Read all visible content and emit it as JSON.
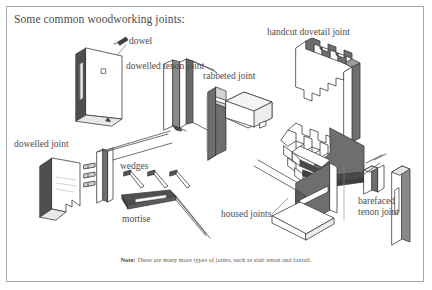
{
  "document": {
    "title": "Some common woodworking joints:",
    "frame_border_color": "#a9a9a9",
    "background_color": "#ffffff",
    "text_color": "#4d4d4d",
    "ink_dark": "#4a4a4a",
    "ink_shade": "#6e6e6e"
  },
  "labels": {
    "dowel": "dowel",
    "dowelled_tenon_joint": "dowelled tenon joint",
    "rabbeted_joint": "rabbeted joint",
    "handcut_dovetail_joint": "handcut dovetail joint",
    "dowelled_joint": "dowelled joint",
    "wedges": "wedges",
    "mortise": "mortise",
    "housed_joints": "housed joints",
    "barefaced_line1": "barefaced",
    "barefaced_line2": "tenon joint"
  },
  "note": {
    "prefix": "Note:",
    "text": " There are many more types of joints, such as stub tenon and foxtail."
  },
  "diagram": {
    "type": "technical-illustration",
    "subject": "woodworking joints",
    "items": [
      {
        "name": "dowel",
        "position": "top-left"
      },
      {
        "name": "dowelled tenon joint",
        "position": "top-left"
      },
      {
        "name": "rabbeted joint",
        "position": "top-center"
      },
      {
        "name": "handcut dovetail joint",
        "position": "top-right"
      },
      {
        "name": "dowelled joint",
        "position": "middle-left"
      },
      {
        "name": "wedges",
        "position": "middle-center"
      },
      {
        "name": "mortise",
        "position": "middle-center"
      },
      {
        "name": "housed joints",
        "position": "bottom-center"
      },
      {
        "name": "barefaced tenon joint",
        "position": "bottom-right"
      }
    ]
  }
}
